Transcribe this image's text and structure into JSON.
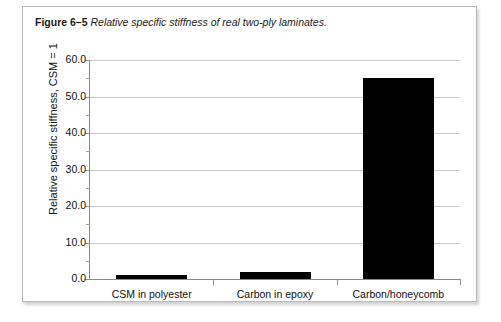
{
  "caption": {
    "figure_label": "Figure 6–5",
    "figure_text": "Relative specific stiffness of real two-ply laminates."
  },
  "chart_data": {
    "type": "bar",
    "title": "",
    "xlabel": "",
    "ylabel": "Relative specific stiffness, CSM = 1",
    "categories": [
      "CSM in polyester",
      "Carbon in epoxy",
      "Carbon/honeycomb"
    ],
    "values": [
      1.0,
      2.0,
      55.0
    ],
    "ylim": [
      0.0,
      60.0
    ],
    "ytick_labels": [
      "0.0",
      "10.0",
      "20.0",
      "30.0",
      "40.0",
      "50.0",
      "60.0"
    ],
    "ytick_values": [
      0,
      10,
      20,
      30,
      40,
      50,
      60
    ],
    "yminor_values": [
      5,
      15,
      25,
      35,
      45,
      55
    ],
    "grid": true,
    "legend": "none",
    "bar_color": "#000000",
    "grid_color": "#c9c9c9",
    "axis_color": "#8a8a8a"
  }
}
